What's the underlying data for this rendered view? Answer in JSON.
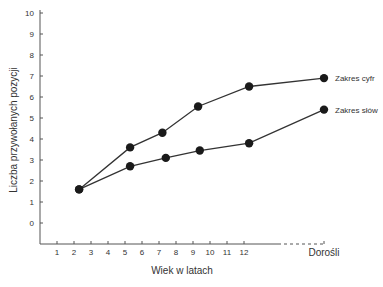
{
  "chart_data": {
    "type": "line",
    "title": "",
    "xlabel": "Wiek w latach",
    "ylabel": "Liczba przywołanych pozycji",
    "x_ticks": [
      "1",
      "2",
      "3",
      "4",
      "5",
      "6",
      "7",
      "8",
      "9",
      "10",
      "11",
      "12"
    ],
    "x_extra_tick": "Dorośli",
    "y_ticks": [
      "0",
      "1",
      "2",
      "3",
      "4",
      "5",
      "6",
      "7",
      "8",
      "9",
      "10"
    ],
    "ylim": [
      -1,
      10
    ],
    "grid": false,
    "legend_position": "inline-right",
    "series": [
      {
        "name": "Zakres cyfr",
        "points": [
          {
            "x": 2.3,
            "y": 1.6
          },
          {
            "x": 5.3,
            "y": 3.6
          },
          {
            "x": 7.2,
            "y": 4.3
          },
          {
            "x": 9.3,
            "y": 5.55
          },
          {
            "x": 12.3,
            "y": 6.5
          },
          {
            "x": "Dorośli",
            "y": 6.9
          }
        ]
      },
      {
        "name": "Zakres słów",
        "points": [
          {
            "x": 2.3,
            "y": 1.6
          },
          {
            "x": 5.3,
            "y": 2.7
          },
          {
            "x": 7.4,
            "y": 3.1
          },
          {
            "x": 9.4,
            "y": 3.45
          },
          {
            "x": 12.3,
            "y": 3.8
          },
          {
            "x": "Dorośli",
            "y": 5.4
          }
        ]
      }
    ]
  },
  "colors": {
    "line": "#333333",
    "marker": "#1a1a1a",
    "axis": "#555555"
  }
}
